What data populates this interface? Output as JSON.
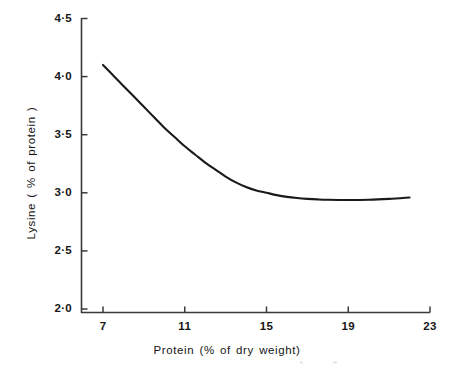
{
  "chart_data": {
    "type": "line",
    "title": "",
    "xlabel": "Protein (% of dry weight)",
    "ylabel": "Lysine ( % of protein )",
    "xlim": [
      6,
      23
    ],
    "ylim": [
      2.0,
      4.5
    ],
    "xticks": [
      7,
      11,
      15,
      19,
      23
    ],
    "xtick_labels": [
      "7",
      "11",
      "15",
      "19",
      "23"
    ],
    "yticks": [
      2.0,
      2.5,
      3.0,
      3.5,
      4.0,
      4.5
    ],
    "ytick_labels": [
      "2·0",
      "2·5",
      "3·0",
      "3·5",
      "4·0",
      "4·5"
    ],
    "grid": false,
    "legend": "none",
    "series": [
      {
        "name": "Lysine vs protein",
        "color": "#1a1a1a",
        "x": [
          7.0,
          7.5,
          8.0,
          8.5,
          9.0,
          9.5,
          10.0,
          10.5,
          11.0,
          11.5,
          12.0,
          12.5,
          13.0,
          13.5,
          14.0,
          14.5,
          15.0,
          15.5,
          16.0,
          16.5,
          17.0,
          17.5,
          18.0,
          19.0,
          20.0,
          21.0,
          22.0
        ],
        "y": [
          4.1,
          4.01,
          3.92,
          3.83,
          3.74,
          3.65,
          3.56,
          3.48,
          3.4,
          3.33,
          3.26,
          3.2,
          3.14,
          3.09,
          3.05,
          3.02,
          3.0,
          2.98,
          2.965,
          2.955,
          2.948,
          2.943,
          2.94,
          2.938,
          2.94,
          2.948,
          2.96
        ]
      }
    ]
  },
  "axis": {
    "x_title": "Protein (% of dry weight)",
    "y_title": "Lysine ( % of protein )"
  }
}
